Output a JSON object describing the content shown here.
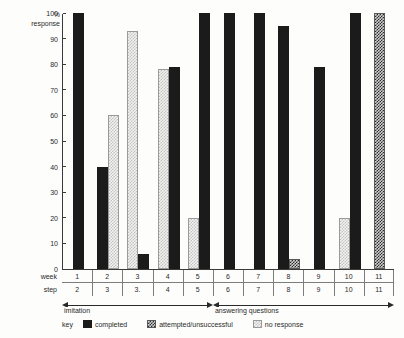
{
  "chart_data": {
    "type": "bar",
    "title": "",
    "xlabel": "",
    "ylabel": "% response",
    "ylim": [
      0,
      100
    ],
    "ytick_values": [
      0,
      10,
      20,
      30,
      40,
      50,
      60,
      70,
      80,
      90,
      100
    ],
    "grid": false,
    "legend_position": "bottom-left",
    "axis_rows": [
      {
        "name": "week",
        "label": "week",
        "values": [
          "1",
          "2",
          "3",
          "4",
          "5",
          "6",
          "7",
          "8",
          "9",
          "10",
          "11"
        ]
      },
      {
        "name": "step",
        "label": "step",
        "values": [
          "2",
          "3",
          "3.",
          "4",
          "5",
          "6",
          "7",
          "8",
          "9",
          "10",
          "11"
        ]
      }
    ],
    "phases": [
      {
        "label": "imitation",
        "from_week": 1,
        "to_week": 5
      },
      {
        "label": "answering questions",
        "from_week": 6,
        "to_week": 11
      }
    ],
    "series": [
      {
        "name": "completed",
        "color": "#1b1b1b",
        "pattern": "solid"
      },
      {
        "name": "attempted/unsuccessful",
        "color": "#2b2b2b",
        "pattern": "dark-check"
      },
      {
        "name": "no response",
        "color": "#c2c2c2",
        "pattern": "light-check"
      }
    ],
    "categories": [
      "1",
      "2",
      "3",
      "4",
      "5",
      "6",
      "7",
      "8",
      "9",
      "10",
      "11"
    ],
    "bars": [
      {
        "week": "1",
        "series": "completed",
        "value": 100
      },
      {
        "week": "2",
        "series": "completed",
        "value": 40
      },
      {
        "week": "2",
        "series": "no response",
        "value": 60
      },
      {
        "week": "3",
        "series": "no response",
        "value": 93
      },
      {
        "week": "3",
        "series": "completed",
        "value": 6
      },
      {
        "week": "4",
        "series": "no response",
        "value": 78
      },
      {
        "week": "4",
        "series": "completed",
        "value": 79
      },
      {
        "week": "5",
        "series": "no response",
        "value": 20
      },
      {
        "week": "5",
        "series": "completed",
        "value": 100
      },
      {
        "week": "6",
        "series": "completed",
        "value": 100
      },
      {
        "week": "7",
        "series": "completed",
        "value": 100
      },
      {
        "week": "8",
        "series": "completed",
        "value": 95
      },
      {
        "week": "8",
        "series": "attempted/unsuccessful",
        "value": 4
      },
      {
        "week": "9",
        "series": "completed",
        "value": 79
      },
      {
        "week": "10",
        "series": "no response",
        "value": 20
      },
      {
        "week": "10",
        "series": "completed",
        "value": 100
      },
      {
        "week": "11",
        "series": "attempted/unsuccessful",
        "value": 100
      }
    ]
  },
  "legend": {
    "key_label": "key",
    "items": [
      {
        "label": "completed",
        "swatch": "completed-swatch"
      },
      {
        "label": "attempted/unsuccessful",
        "swatch": "attempted-swatch"
      },
      {
        "label": "no response",
        "swatch": "noresponse-swatch"
      }
    ]
  },
  "yaxis": {
    "title_line1": "%",
    "title_line2": "response",
    "ticks": [
      "100",
      "90",
      "80",
      "70",
      "60",
      "50",
      "40",
      "30",
      "20",
      "10",
      "0"
    ]
  }
}
